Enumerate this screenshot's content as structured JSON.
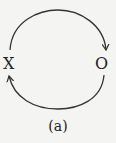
{
  "diagram": {
    "nodes": [
      {
        "id": "X",
        "label": "X"
      },
      {
        "id": "O",
        "label": "O"
      }
    ],
    "edges": [
      {
        "from": "X",
        "to": "O",
        "path": "top-arc"
      },
      {
        "from": "O",
        "to": "X",
        "path": "bottom-arc"
      }
    ],
    "caption": "(a)",
    "colors": {
      "stroke": "#333333",
      "text": "#222222",
      "background": "#f4f4f2"
    }
  }
}
